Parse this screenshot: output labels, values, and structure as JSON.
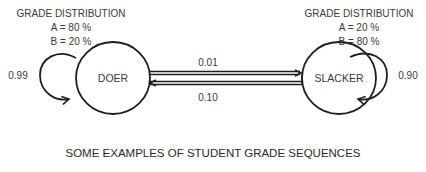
{
  "diagram": {
    "type": "markov-chain",
    "states": [
      {
        "id": "doer",
        "label": "DOER",
        "distribution_title": "GRADE DISTRIBUTION",
        "distribution": [
          "A = 80 %",
          "B = 20 %"
        ],
        "self_loop": "0.99"
      },
      {
        "id": "slacker",
        "label": "SLACKER",
        "distribution_title": "GRADE DISTRIBUTION",
        "distribution": [
          "A = 20 %",
          "B = 80 %"
        ],
        "self_loop": "0.90"
      }
    ],
    "transitions": [
      {
        "from": "doer",
        "to": "slacker",
        "label": "0.01"
      },
      {
        "from": "slacker",
        "to": "doer",
        "label": "0.10"
      }
    ],
    "caption": "SOME EXAMPLES OF STUDENT GRADE SEQUENCES"
  }
}
